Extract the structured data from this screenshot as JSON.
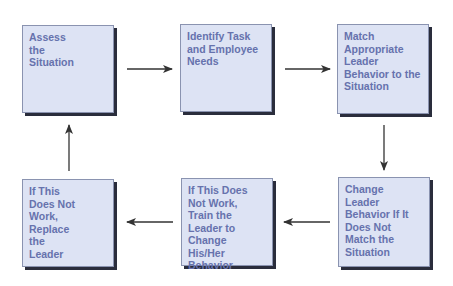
{
  "diagram": {
    "type": "process-cycle",
    "colors": {
      "box_fill": "#dde3f4",
      "box_border": "#8a93b0",
      "box_shadow": "#2a2d3c",
      "text": "#6672ad",
      "arrow": "#333333"
    },
    "boxes": [
      {
        "id": "assess",
        "label": "Assess\nthe\nSituation"
      },
      {
        "id": "identify",
        "label": "Identify Task\nand Employee\nNeeds"
      },
      {
        "id": "match",
        "label": "Match\nAppropriate\nLeader\nBehavior to the\nSituation"
      },
      {
        "id": "change",
        "label": "Change\nLeader\nBehavior If It\nDoes Not\nMatch the\nSituation"
      },
      {
        "id": "train",
        "label": "If This Does\nNot Work,\nTrain the\nLeader to\nChange His/Her\nBehavior"
      },
      {
        "id": "replace",
        "label": "If This\nDoes Not\nWork,\nReplace\nthe\nLeader"
      }
    ],
    "arrows": [
      {
        "from": "assess",
        "to": "identify",
        "direction": "right"
      },
      {
        "from": "identify",
        "to": "match",
        "direction": "right"
      },
      {
        "from": "match",
        "to": "change",
        "direction": "down"
      },
      {
        "from": "change",
        "to": "train",
        "direction": "left"
      },
      {
        "from": "train",
        "to": "replace",
        "direction": "left"
      },
      {
        "from": "replace",
        "to": "assess",
        "direction": "up"
      }
    ]
  }
}
